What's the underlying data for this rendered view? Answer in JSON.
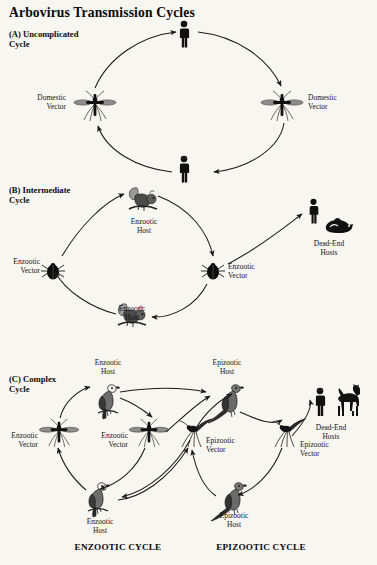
{
  "title": "Arbovirus Transmission Cycles",
  "sections": [
    {
      "id": "a",
      "heading": "(A) Uncomplicated\nCycle",
      "labels": [
        {
          "key": "human_top",
          "text": ""
        },
        {
          "key": "vector_left",
          "text": "Domestic\nVector"
        },
        {
          "key": "vector_right",
          "text": "Domestic\nVector"
        },
        {
          "key": "human_bottom",
          "text": ""
        }
      ]
    },
    {
      "id": "b",
      "heading": "(B) Intermediate\nCycle",
      "labels": [
        {
          "key": "host_top",
          "text": "Enzootic\nHost"
        },
        {
          "key": "vector_left",
          "text": "Enzootic\nVector"
        },
        {
          "key": "vector_center",
          "text": "Enzootic\nVector"
        },
        {
          "key": "host_bottom",
          "text": "Enzootic\nHost"
        },
        {
          "key": "dead_end",
          "text": "Dead-End\nHosts"
        }
      ]
    },
    {
      "id": "c",
      "heading": "(C) Complex\nCycle",
      "labels": [
        {
          "key": "enz_host_top",
          "text": "Enzootic\nHost"
        },
        {
          "key": "epi_host_top",
          "text": "Epizootic\nHost"
        },
        {
          "key": "enz_vector_left",
          "text": "Enzootic\nVector"
        },
        {
          "key": "enz_vector_mid",
          "text": "Enzootic\nVector"
        },
        {
          "key": "epi_vector_mid",
          "text": "Epizootic\nVector"
        },
        {
          "key": "epi_vector_right",
          "text": "Epizootic\nVector"
        },
        {
          "key": "enz_host_bottom",
          "text": "Enzootic\nHost"
        },
        {
          "key": "epi_host_bottom",
          "text": "Epizootic\nHost"
        },
        {
          "key": "dead_end",
          "text": "Dead-End\nHosts"
        }
      ],
      "captions": [
        {
          "key": "enzootic_cycle",
          "text": "ENZOOTIC CYCLE"
        },
        {
          "key": "epizootic_cycle",
          "text": "EPIZOOTIC CYCLE"
        }
      ]
    }
  ],
  "icons": {
    "human": "human-figure-icon",
    "mosquito": "mosquito-icon",
    "tick": "tick-icon",
    "squirrel": "squirrel-icon",
    "bird": "bird-icon",
    "pheasant": "pheasant-icon",
    "horse": "horse-icon",
    "pig": "pig-icon",
    "arrow": "curved-arrow-icon"
  },
  "colors": {
    "background": "#f7f6f1",
    "ink": "#101010",
    "arrow": "#1a1a1a"
  }
}
